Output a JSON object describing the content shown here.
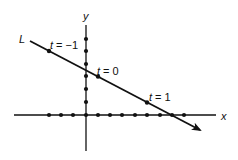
{
  "figure": {
    "type": "parametric-line-diagram",
    "axes": {
      "x_label": "x",
      "y_label": "y",
      "x_ticks_px": [
        49,
        61,
        73,
        86,
        98,
        110,
        122,
        135,
        147,
        160,
        172,
        184
      ],
      "y_ticks_px": [
        39,
        51,
        64,
        76,
        89,
        102,
        115
      ]
    },
    "line": {
      "label": "L",
      "points": [
        {
          "label": "t = -1",
          "t": -1
        },
        {
          "label": "t = 0",
          "t": 0
        },
        {
          "label": "t = 1",
          "t": 1
        }
      ]
    },
    "colors": {
      "ink": "#111111",
      "background": "#ffffff"
    }
  }
}
